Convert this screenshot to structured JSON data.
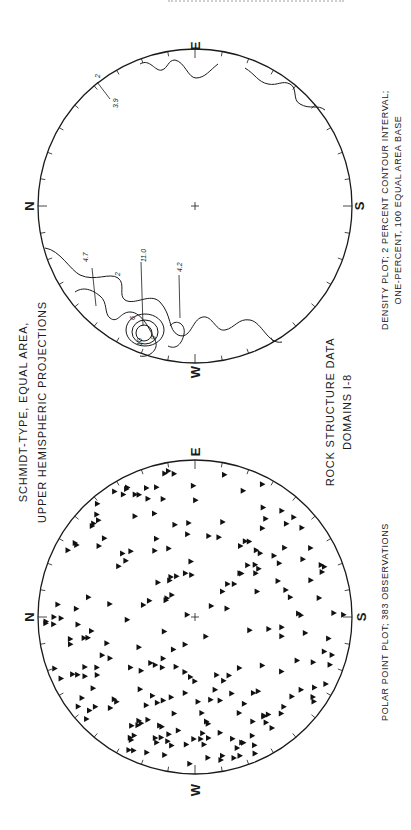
{
  "page": {
    "header_text": "",
    "orientation": "rotated 90° counter-clockwise (landscape figure on portrait page)"
  },
  "figure": {
    "title_line1": "SCHMIDT-TYPE, EQUAL AREA,",
    "title_line2": "UPPER HEMISPHERIC PROJECTIONS",
    "subtitle_line1": "ROCK STRUCTURE DATA",
    "subtitle_line2": "DOMAINS I-8"
  },
  "chart_data": [
    {
      "type": "scatter",
      "name": "polar-point-plot",
      "projection": "Schmidt equal-area, upper hemisphere",
      "caption": "POLAR POINT PLOT;  383   OBSERVATIONS",
      "observations": 383,
      "direction_labels": {
        "n": "N",
        "e": "E",
        "s": "S",
        "w": "W"
      },
      "marker": "filled triangle",
      "point_density_by_sector": [
        {
          "sector": "W to NW margin",
          "relative_density": "very high"
        },
        {
          "sector": "N margin",
          "relative_density": "high"
        },
        {
          "sector": "NE margin",
          "relative_density": "moderate"
        },
        {
          "sector": "S to SE margin",
          "relative_density": "moderate"
        },
        {
          "sector": "center",
          "relative_density": "low"
        }
      ]
    },
    {
      "type": "heatmap",
      "name": "density-contour-plot",
      "projection": "Schmidt equal-area, upper hemisphere",
      "caption_line1": "DENSITY PLOT; 2   PERCENT CONTOUR INTERVAL;",
      "caption_line2": "ONE-PERCENT, 100 EQUAL AREA BASE",
      "contour_interval_percent": 2,
      "contour_levels": [
        2,
        4,
        6,
        8,
        10
      ],
      "direction_labels": {
        "n": "N",
        "e": "E",
        "s": "S",
        "w": "W"
      },
      "maxima_annotations": [
        {
          "label": "11.0",
          "location": "near W, strongest maximum"
        },
        {
          "label": "4.7",
          "location": "NW of W"
        },
        {
          "label": "4.2",
          "location": "N of W maximum"
        },
        {
          "label": "3.9",
          "location": "near E-S margin"
        },
        {
          "label": "2",
          "location": "contour label near E margin"
        }
      ]
    }
  ]
}
